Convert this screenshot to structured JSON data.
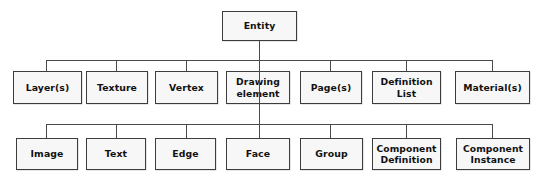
{
  "diagram": {
    "type": "hierarchy-tree",
    "colors": {
      "node_fill": "#f7f7f7",
      "node_border": "#3c3c3c",
      "edge": "#4a4a4a",
      "text": "#111111",
      "background": "#ffffff"
    },
    "root": {
      "label": "Entity"
    },
    "level2": [
      {
        "label": "Layer(s)"
      },
      {
        "label": "Texture"
      },
      {
        "label": "Vertex"
      },
      {
        "label": "Drawing\nelement"
      },
      {
        "label": "Page(s)"
      },
      {
        "label": "Definition\nList"
      },
      {
        "label": "Material(s)"
      }
    ],
    "level3": [
      {
        "label": "Image"
      },
      {
        "label": "Text"
      },
      {
        "label": "Edge"
      },
      {
        "label": "Face"
      },
      {
        "label": "Group"
      },
      {
        "label": "Component\nDefinition"
      },
      {
        "label": "Component\nInstance"
      }
    ],
    "relations": {
      "root_children": [
        "Layer(s)",
        "Texture",
        "Vertex",
        "Drawing element",
        "Page(s)",
        "Definition List",
        "Material(s)"
      ],
      "drawing_element_children": [
        "Image",
        "Text",
        "Edge",
        "Face",
        "Group",
        "Component Definition",
        "Component Instance"
      ]
    }
  }
}
